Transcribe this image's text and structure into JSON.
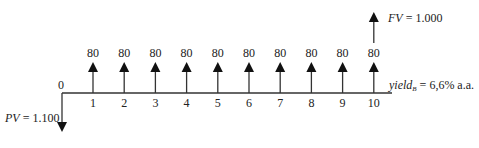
{
  "diagram": {
    "type": "cash-flow-timeline",
    "origin_label": "0",
    "periods": [
      "1",
      "2",
      "3",
      "4",
      "5",
      "6",
      "7",
      "8",
      "9",
      "10"
    ],
    "coupons": [
      "80",
      "80",
      "80",
      "80",
      "80",
      "80",
      "80",
      "80",
      "80",
      "80"
    ],
    "pv": {
      "symbol": "PV",
      "text": " = 1.100"
    },
    "fv": {
      "symbol": "FV",
      "text": " = 1.000"
    },
    "yield": {
      "symbol": "yield",
      "subscript": "B",
      "text": " = 6,6% a.a."
    }
  }
}
